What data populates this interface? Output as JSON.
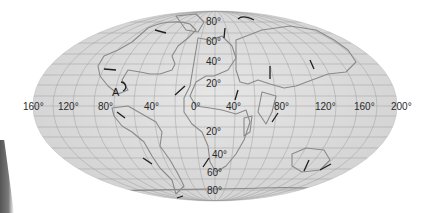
{
  "map": {
    "projection": "elliptical world map (Mollweide-style)",
    "background_color": "#ffffff",
    "ocean_color": "#dcdcdc",
    "grid_color": "#9a9a9a",
    "coast_color": "#8a8a8a",
    "arrow_color": "#1e1e1e",
    "longitude_labels": [
      "160°",
      "120°",
      "80°",
      "40°",
      "0°",
      "40°",
      "80°",
      "120°",
      "160°",
      "200°"
    ],
    "latitude_labels_north": [
      "80°",
      "60°",
      "40°",
      "20°"
    ],
    "latitude_labels_south": [
      "20°",
      "40°",
      "60°",
      "80°"
    ],
    "marker": {
      "label": "A"
    },
    "arrows": [
      {
        "region": "Greenland/Arctic",
        "direction": "west"
      },
      {
        "region": "North Pole area",
        "direction": "north"
      },
      {
        "region": "Siberia Arctic",
        "direction": "east-curved"
      },
      {
        "region": "North America",
        "direction": "west"
      },
      {
        "region": "North Atlantic",
        "direction": "northeast"
      },
      {
        "region": "Arabia",
        "direction": "north"
      },
      {
        "region": "Central Asia",
        "direction": "north"
      },
      {
        "region": "East Asia",
        "direction": "south"
      },
      {
        "region": "South America north",
        "direction": "northwest"
      },
      {
        "region": "South America south",
        "direction": "northwest"
      },
      {
        "region": "South Atlantic",
        "direction": "northeast"
      },
      {
        "region": "Antarctic",
        "direction": "east"
      },
      {
        "region": "India",
        "direction": "northeast"
      },
      {
        "region": "Australia",
        "direction": "north"
      },
      {
        "region": "New Zealand",
        "direction": "northeast"
      }
    ]
  }
}
